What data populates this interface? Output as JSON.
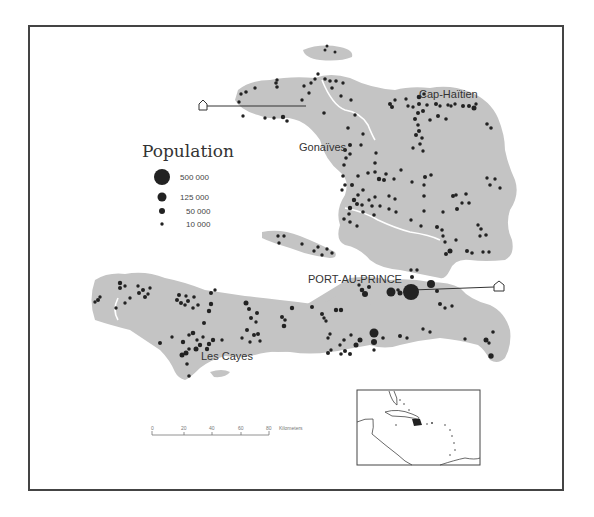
{
  "map": {
    "legend": {
      "title": "Population",
      "items": [
        {
          "label": "500 000",
          "radius": 8
        },
        {
          "label": "125 000",
          "radius": 4.5
        },
        {
          "label": "50 000",
          "radius": 3
        },
        {
          "label": "10 000",
          "radius": 1.7
        }
      ]
    },
    "cities": [
      {
        "name": "Cap-Haïtien"
      },
      {
        "name": "Gonaïves"
      },
      {
        "name": "PORT-AU-PRINCE"
      },
      {
        "name": "Les Cayes"
      }
    ],
    "scale_bar": {
      "ticks": [
        "0",
        "20",
        "40",
        "60",
        "80"
      ],
      "unit": "Kilometers"
    },
    "colors": {
      "land": "#c4c4c4",
      "dots": "#222222",
      "frame": "#444444",
      "rivers": "#ffffff"
    }
  }
}
